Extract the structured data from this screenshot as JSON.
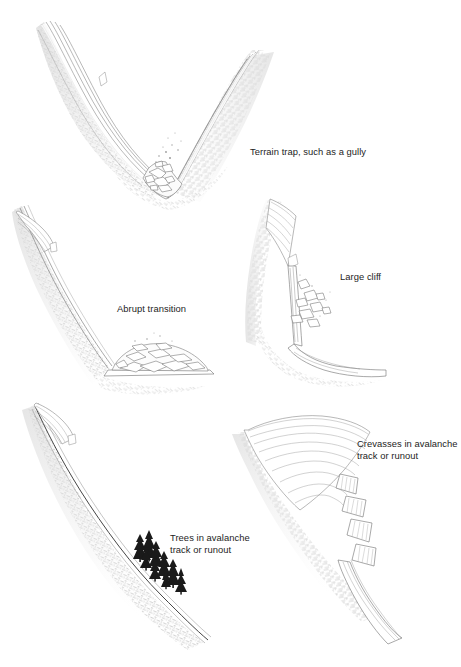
{
  "figure": {
    "style": "pen-and-ink hatched line drawing",
    "background_color": "#ffffff",
    "ink_color": "#5a5a5a",
    "text_color": "#1d1d1d",
    "terrain_fill": "#f2f2f2",
    "hatch_color": "#c9c9c9",
    "tree_color": "#1a1a1a",
    "snow_color": "#ffffff"
  },
  "panels": [
    {
      "id": "gully",
      "name": "terrain-trap-gully",
      "caption": "Terrain trap, such as a gully",
      "caption_lines": [
        "Terrain trap, such as a gully"
      ],
      "description": "V-shaped gully cross-section with hatched slopes on both sides and a pile of angular snow debris filling the narrow bottom"
    },
    {
      "id": "abrupt",
      "name": "abrupt-transition",
      "caption": "Abrupt transition",
      "caption_lines": [
        "Abrupt transition"
      ],
      "description": "Steep planar slope meeting flat valley floor at a sharp angle with a mound of avalanche debris at the base"
    },
    {
      "id": "cliff",
      "name": "large-cliff",
      "caption": "Large cliff",
      "caption_lines": [
        "Large cliff"
      ],
      "description": "Slope terminating in a vertical cliff band with snow blocks falling over the edge onto the bench below"
    },
    {
      "id": "trees",
      "name": "trees-in-avalanche-track",
      "caption": "Trees in avalanche track or runout",
      "caption_lines": [
        "Trees in avalanche",
        "track or runout"
      ],
      "description": "Long concave slope with a cluster of dark conifer trees standing in the lower track and runout zone",
      "tree_count": 9
    },
    {
      "id": "crevasse",
      "name": "crevasses-in-avalanche-track",
      "caption": "Crevasses in avalanche track or runout",
      "caption_lines": [
        "Crevasses in avalanche",
        "track or runout"
      ],
      "description": "Curving glacier surface with flow lines broken by a series of open crevasse blocks in the track and runout",
      "crevasse_count": 4
    }
  ]
}
